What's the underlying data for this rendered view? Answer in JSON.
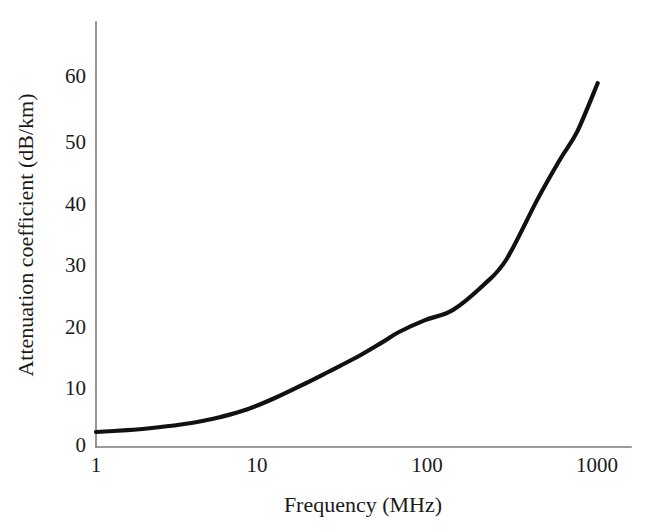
{
  "figure": {
    "background_color": "#ffffff",
    "curve_color": "#111111",
    "axis_color": "#7b7b7b",
    "text_color": "#1a1a1a"
  },
  "axes": {
    "x_title": "Frequency (MHz)",
    "y_title": "Attenuation coefficient (dB/km)",
    "x_tick_labels": [
      "1",
      "10",
      "100",
      "1000"
    ],
    "y_tick_labels": [
      "0",
      "10",
      "20",
      "30",
      "40",
      "50",
      "60"
    ]
  },
  "chart_data": {
    "type": "line",
    "title": "",
    "subtitle": "",
    "xlabel": "Frequency (MHz)",
    "ylabel": "Attenuation coefficient (dB/km)",
    "xscale": "log",
    "yscale": "linear",
    "xlim": [
      1,
      1000
    ],
    "ylim": [
      0,
      68
    ],
    "xticks": [
      1,
      10,
      100,
      1000
    ],
    "xtick_labels": [
      "1",
      "10",
      "100",
      "1000"
    ],
    "yticks": [
      0,
      10,
      20,
      30,
      40,
      50,
      60
    ],
    "ytick_labels": [
      "0",
      "10",
      "20",
      "30",
      "40",
      "50",
      "60"
    ],
    "grid": false,
    "legend": false,
    "legend_position": "none",
    "annotations": [],
    "series": [
      {
        "name": "Attenuation coefficient",
        "color": "#111111",
        "line_width": 4.2,
        "x": [
          1,
          1.5,
          2,
          3,
          4,
          5,
          7,
          10,
          15,
          20,
          30,
          40,
          50,
          70,
          100,
          150,
          200,
          300,
          400,
          500,
          650
        ],
        "values": [
          2.4,
          2.7,
          3.0,
          3.6,
          4.2,
          4.8,
          6.0,
          7.8,
          10.2,
          12.0,
          14.6,
          16.7,
          18.4,
          20.3,
          21.9,
          26.0,
          30.0,
          39.7,
          46.0,
          50.5,
          58.2
        ]
      }
    ]
  }
}
